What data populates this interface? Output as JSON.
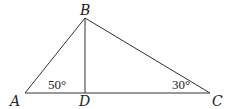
{
  "diagram": {
    "type": "triangle",
    "points": {
      "A": {
        "label": "A",
        "x": 25,
        "y": 93
      },
      "B": {
        "label": "B",
        "x": 85,
        "y": 18
      },
      "C": {
        "label": "C",
        "x": 210,
        "y": 93
      },
      "D": {
        "label": "D",
        "x": 85,
        "y": 93
      }
    },
    "segments": [
      "AB",
      "BC",
      "AC",
      "BD"
    ],
    "angles": {
      "A": {
        "label": "50°"
      },
      "C": {
        "label": "30°"
      }
    }
  }
}
